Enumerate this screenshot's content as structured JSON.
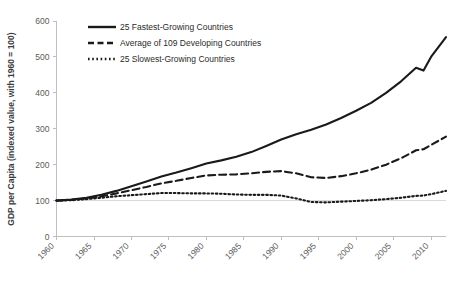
{
  "chart_data": {
    "type": "line",
    "title": "",
    "xlabel": "",
    "ylabel": "GDP per Capita (indexed value, with 1960 = 100)",
    "xlim": [
      1960,
      2012
    ],
    "ylim": [
      0,
      600
    ],
    "ytick_labels": [
      "0",
      "100",
      "200",
      "300",
      "400",
      "500",
      "600"
    ],
    "ytick_values": [
      0,
      100,
      200,
      300,
      400,
      500,
      600
    ],
    "xtick_labels": [
      "1960",
      "1965",
      "1970",
      "1975",
      "1980",
      "1985",
      "1990",
      "1995",
      "2000",
      "2005",
      "2010"
    ],
    "xtick_values": [
      1960,
      1965,
      1970,
      1975,
      1980,
      1985,
      1990,
      1995,
      2000,
      2005,
      2010
    ],
    "grid": "faint horizontal reference line at y = 100",
    "gridline_values": [
      100
    ],
    "legend_position": "top-center",
    "line_color": "#1a1a1a",
    "axis_color": "#bfbfbf",
    "x": [
      1960,
      1962,
      1964,
      1966,
      1968,
      1970,
      1972,
      1974,
      1976,
      1978,
      1980,
      1982,
      1984,
      1986,
      1988,
      1990,
      1992,
      1994,
      1996,
      1998,
      2000,
      2002,
      2004,
      2006,
      2008,
      2009,
      2010,
      2012
    ],
    "series": [
      {
        "name": "25 Fastest-Growing Countries",
        "style": "solid",
        "values": [
          100,
          103,
          108,
          116,
          127,
          140,
          153,
          167,
          178,
          190,
          203,
          212,
          222,
          235,
          252,
          270,
          285,
          297,
          312,
          330,
          350,
          372,
          400,
          432,
          470,
          462,
          500,
          555
        ]
      },
      {
        "name": "Average of 109 Developing Countries",
        "style": "dashed",
        "values": [
          100,
          102,
          106,
          112,
          120,
          129,
          138,
          148,
          155,
          163,
          170,
          172,
          173,
          176,
          180,
          182,
          176,
          165,
          163,
          168,
          176,
          186,
          200,
          218,
          240,
          243,
          255,
          278
        ]
      },
      {
        "name": "25 Slowest-Growing Countries",
        "style": "dotted",
        "values": [
          100,
          101,
          104,
          108,
          112,
          115,
          118,
          121,
          121,
          120,
          120,
          119,
          117,
          116,
          116,
          114,
          106,
          96,
          95,
          97,
          99,
          101,
          104,
          108,
          113,
          114,
          118,
          127
        ]
      }
    ]
  },
  "legend": {
    "items": [
      {
        "label": "25 Fastest-Growing Countries",
        "style": "solid"
      },
      {
        "label": "Average of 109 Developing Countries",
        "style": "dashed"
      },
      {
        "label": "25 Slowest-Growing Countries",
        "style": "dotted"
      }
    ]
  }
}
